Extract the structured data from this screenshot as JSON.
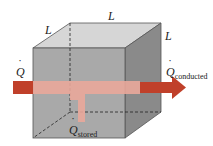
{
  "diagram": {
    "labels": {
      "edge_top": "L",
      "edge_left": "L",
      "edge_right": "L",
      "q_in": "Q",
      "q_conducted": "Q",
      "q_conducted_sub": "conducted",
      "q_stored": "Q",
      "q_stored_sub": "stored"
    },
    "colors": {
      "front_face": "#a9a9a9",
      "top_face": "#d6d6d6",
      "right_face": "#8a8a8a",
      "arrow_dark": "#c0402a",
      "arrow_light": "#e9a79a"
    }
  }
}
